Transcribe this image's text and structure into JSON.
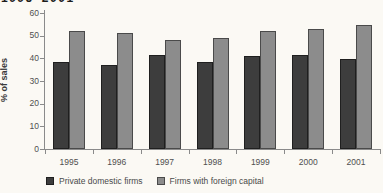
{
  "page": {
    "clipped_title_fragment": "1995–2001"
  },
  "chart_data": {
    "type": "bar",
    "title_fragment_visible": "1995–2001 (top of chart title, cut off)",
    "categories": [
      "1995",
      "1996",
      "1997",
      "1998",
      "1999",
      "2000",
      "2001"
    ],
    "series": [
      {
        "name": "Private domestic firms",
        "color": "#3d3d3d",
        "border": "#1f1f1f",
        "values": [
          38.5,
          37,
          41.5,
          38.5,
          41,
          41.5,
          39.5
        ]
      },
      {
        "name": "Firms with foreign capital",
        "color": "#8c8c8c",
        "border": "#4a4a4a",
        "values": [
          52,
          51,
          48,
          49,
          52,
          53,
          54.5
        ]
      }
    ],
    "xlabel": "",
    "ylabel": "% of sales",
    "ylim": [
      0,
      60
    ],
    "yticks": [
      0,
      10,
      20,
      30,
      40,
      50,
      60
    ],
    "grid": false,
    "legend_position": "bottom"
  }
}
